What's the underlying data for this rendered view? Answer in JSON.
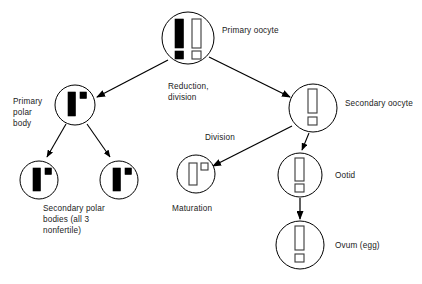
{
  "diagram": {
    "background_color": "#ffffff",
    "line_color": "#000000",
    "text_color": "#1a1a1a",
    "labels": {
      "primary_oocyte": "Primary oocyte",
      "primary_polar_body_l1": "Primary",
      "primary_polar_body_l2": "polar",
      "primary_polar_body_l3": "body",
      "reduction_l1": "Reduction,",
      "reduction_l2": "division",
      "secondary_oocyte": "Secondary oocyte",
      "division": "Division",
      "secondary_polar_bodies_l1": "Secondary polar",
      "secondary_polar_bodies_l2": "bodies (all 3",
      "secondary_polar_bodies_l3": "nonfertile)",
      "maturation": "Maturation",
      "ootid": "Ootid",
      "ovum": "Ovum (egg)"
    },
    "cells": [
      {
        "name": "primary-oocyte",
        "label": "Primary oocyte",
        "cx": 188,
        "cy": 38,
        "r": 26,
        "chromosomes": [
          {
            "type": "filled",
            "shape": "long-bar"
          },
          {
            "type": "open",
            "shape": "long-bar"
          },
          {
            "type": "filled",
            "shape": "small-square"
          },
          {
            "type": "open",
            "shape": "small-square"
          }
        ]
      },
      {
        "name": "primary-polar-body",
        "label": "Primary polar body",
        "cx": 75,
        "cy": 105,
        "r": 20,
        "chromosomes": [
          {
            "type": "filled",
            "shape": "long-bar"
          },
          {
            "type": "filled",
            "shape": "small-square"
          }
        ]
      },
      {
        "name": "secondary-oocyte",
        "label": "Secondary oocyte",
        "cx": 313,
        "cy": 108,
        "r": 24,
        "chromosomes": [
          {
            "type": "open",
            "shape": "long-bar"
          },
          {
            "type": "open",
            "shape": "small-square"
          }
        ]
      },
      {
        "name": "secondary-polar-body-left",
        "label": "Secondary polar body",
        "cx": 39,
        "cy": 180,
        "r": 19,
        "chromosomes": [
          {
            "type": "filled",
            "shape": "long-bar"
          },
          {
            "type": "filled",
            "shape": "small-square"
          }
        ]
      },
      {
        "name": "secondary-polar-body-right",
        "label": "Secondary polar body",
        "cx": 119,
        "cy": 180,
        "r": 19,
        "chromosomes": [
          {
            "type": "filled",
            "shape": "long-bar"
          },
          {
            "type": "filled",
            "shape": "small-square"
          }
        ]
      },
      {
        "name": "maturation-polar-body",
        "label": "Maturation",
        "cx": 196,
        "cy": 174,
        "r": 19,
        "chromosomes": [
          {
            "type": "open",
            "shape": "long-bar"
          },
          {
            "type": "open",
            "shape": "small-square"
          }
        ]
      },
      {
        "name": "ootid",
        "label": "Ootid",
        "cx": 300,
        "cy": 175,
        "r": 22,
        "chromosomes": [
          {
            "type": "open",
            "shape": "long-bar"
          },
          {
            "type": "open",
            "shape": "small-square"
          }
        ]
      },
      {
        "name": "ovum",
        "label": "Ovum (egg)",
        "cx": 300,
        "cy": 245,
        "r": 24,
        "chromosomes": [
          {
            "type": "open",
            "shape": "long-bar"
          },
          {
            "type": "open",
            "shape": "small-square"
          }
        ]
      }
    ],
    "arrows": [
      {
        "name": "primary-oocyte-to-primary-polar-body",
        "from": "primary-oocyte",
        "to": "primary-polar-body",
        "process": "Reduction, division"
      },
      {
        "name": "primary-oocyte-to-secondary-oocyte",
        "from": "primary-oocyte",
        "to": "secondary-oocyte",
        "process": "Reduction, division"
      },
      {
        "name": "primary-polar-body-to-secondary-polar-body-left",
        "from": "primary-polar-body",
        "to": "secondary-polar-body-left",
        "process": "Division"
      },
      {
        "name": "primary-polar-body-to-secondary-polar-body-right",
        "from": "primary-polar-body",
        "to": "secondary-polar-body-right",
        "process": "Division"
      },
      {
        "name": "secondary-oocyte-to-maturation",
        "from": "secondary-oocyte",
        "to": "maturation-polar-body",
        "process": "Division"
      },
      {
        "name": "secondary-oocyte-to-ootid",
        "from": "secondary-oocyte",
        "to": "ootid",
        "process": "Division"
      },
      {
        "name": "ootid-to-ovum",
        "from": "ootid",
        "to": "ovum",
        "process": "Maturation"
      }
    ]
  }
}
